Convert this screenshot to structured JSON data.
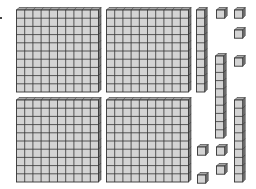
{
  "diagram": {
    "colors": {
      "face": "#d4d4d4",
      "grid": "#333333",
      "side": "#7a7a7a",
      "top": "#a8a8a8"
    },
    "unit": 8.2,
    "flats": [
      {
        "name": "hundred-flat-1",
        "x": 16,
        "y": 7
      },
      {
        "name": "hundred-flat-2",
        "x": 106,
        "y": 7
      },
      {
        "name": "hundred-flat-3",
        "x": 16,
        "y": 97
      },
      {
        "name": "hundred-flat-4",
        "x": 106,
        "y": 97
      }
    ],
    "rods": [
      {
        "name": "ten-rod-1",
        "x": 196,
        "y": 7
      },
      {
        "name": "ten-rod-2",
        "x": 215,
        "y": 53
      },
      {
        "name": "ten-rod-3",
        "x": 234,
        "y": 97
      }
    ],
    "units": [
      {
        "name": "unit-cube-1",
        "x": 216,
        "y": 7
      },
      {
        "name": "unit-cube-2",
        "x": 234,
        "y": 7
      },
      {
        "name": "unit-cube-3",
        "x": 234,
        "y": 27
      },
      {
        "name": "unit-cube-4",
        "x": 234,
        "y": 55
      },
      {
        "name": "unit-cube-5",
        "x": 197,
        "y": 144
      },
      {
        "name": "unit-cube-6",
        "x": 216,
        "y": 144
      },
      {
        "name": "unit-cube-7",
        "x": 216,
        "y": 163
      },
      {
        "name": "unit-cube-8",
        "x": 197,
        "y": 172
      }
    ],
    "counts": {
      "hundreds": 4,
      "tens": 3,
      "ones": 8,
      "total": 438
    }
  }
}
